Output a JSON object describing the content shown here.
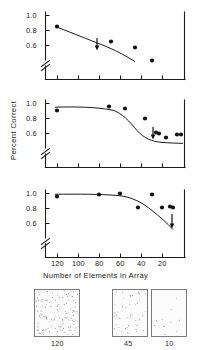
{
  "figure": {
    "axis_title_x": "Number  of  Elements  in  Array",
    "axis_title_y": "Percent  Correct",
    "y_ticks": [
      "1.0",
      "0.8",
      "0.6"
    ],
    "x_ticks": [
      "120",
      "100",
      "80",
      "60",
      "40",
      "20"
    ],
    "axis_break_symbol": "//",
    "ink_color": "#1b1b1b",
    "point_color": "#111111"
  },
  "chart_data": {
    "type": "scatter",
    "title": "",
    "xlabel": "Number of Elements in Array",
    "ylabel": "Percent Correct",
    "xlim": [
      130,
      0
    ],
    "ylim": [
      0.5,
      1.02
    ],
    "x_ticks": [
      120,
      100,
      80,
      60,
      40,
      20
    ],
    "y_ticks": [
      1.0,
      0.8,
      0.6
    ],
    "x_axis_inverted": true,
    "y_axis_break": true,
    "grid": false,
    "legend": "none",
    "panels": [
      {
        "name": "panel-top",
        "points": [
          {
            "x": 120,
            "y": 0.8
          },
          {
            "x": 68,
            "y": 0.635
          },
          {
            "x": 45,
            "y": 0.6
          },
          {
            "x": 28,
            "y": 0.545
          }
        ],
        "fit_curve": [
          {
            "x": 124,
            "y": 0.805
          },
          {
            "x": 100,
            "y": 0.745
          },
          {
            "x": 80,
            "y": 0.695
          },
          {
            "x": 60,
            "y": 0.645
          },
          {
            "x": 45,
            "y": 0.605
          },
          {
            "x": 33,
            "y": 0.565
          },
          {
            "x": 26,
            "y": 0.535
          }
        ],
        "arrow_markers": [
          {
            "x": 80,
            "y": 0.635,
            "direction": "down"
          }
        ]
      },
      {
        "name": "panel-middle",
        "points": [
          {
            "x": 120,
            "y": 0.905
          },
          {
            "x": 70,
            "y": 0.955
          },
          {
            "x": 55,
            "y": 0.935
          },
          {
            "x": 36,
            "y": 0.8
          },
          {
            "x": 25,
            "y": 0.625
          },
          {
            "x": 22,
            "y": 0.615
          },
          {
            "x": 15,
            "y": 0.565
          },
          {
            "x": 8,
            "y": 0.605
          },
          {
            "x": 5,
            "y": 0.605
          }
        ],
        "fit_curve": [
          {
            "x": 126,
            "y": 0.945
          },
          {
            "x": 100,
            "y": 0.95
          },
          {
            "x": 80,
            "y": 0.952
          },
          {
            "x": 62,
            "y": 0.94
          },
          {
            "x": 50,
            "y": 0.905
          },
          {
            "x": 40,
            "y": 0.845
          },
          {
            "x": 32,
            "y": 0.755
          },
          {
            "x": 25,
            "y": 0.665
          },
          {
            "x": 18,
            "y": 0.605
          },
          {
            "x": 10,
            "y": 0.575
          },
          {
            "x": 3,
            "y": 0.565
          }
        ],
        "arrow_markers": [
          {
            "x": 27,
            "y": 0.645,
            "direction": "down"
          }
        ]
      },
      {
        "name": "panel-bottom",
        "points": [
          {
            "x": 120,
            "y": 0.925
          },
          {
            "x": 80,
            "y": 0.95
          },
          {
            "x": 60,
            "y": 0.965
          },
          {
            "x": 43,
            "y": 0.775
          },
          {
            "x": 30,
            "y": 0.95
          },
          {
            "x": 20,
            "y": 0.775
          },
          {
            "x": 12,
            "y": 0.79
          },
          {
            "x": 9,
            "y": 0.775
          }
        ],
        "fit_curve": [
          {
            "x": 126,
            "y": 0.985
          },
          {
            "x": 100,
            "y": 0.985
          },
          {
            "x": 80,
            "y": 0.985
          },
          {
            "x": 62,
            "y": 0.975
          },
          {
            "x": 50,
            "y": 0.945
          },
          {
            "x": 40,
            "y": 0.905
          },
          {
            "x": 30,
            "y": 0.865
          },
          {
            "x": 20,
            "y": 0.815
          },
          {
            "x": 12,
            "y": 0.765
          },
          {
            "x": 6,
            "y": 0.705
          }
        ],
        "arrow_markers": [
          {
            "x": 9,
            "y": 0.72,
            "direction": "down"
          }
        ]
      }
    ]
  },
  "stimuli": {
    "caption_note": "",
    "panels": [
      {
        "label": "120",
        "density": 120
      },
      {
        "label": "45",
        "density": 45
      },
      {
        "label": "10",
        "density": 10
      }
    ]
  }
}
